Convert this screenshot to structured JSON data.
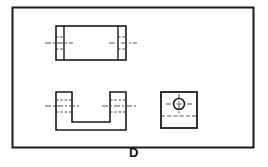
{
  "figure": {
    "label": "D",
    "frame": {
      "x": 12,
      "y": 7,
      "width": 242,
      "height": 141,
      "stroke": "#1a1a1a",
      "stroke_width": 2
    },
    "colors": {
      "background": "#ffffff",
      "line": "#1a1a1a",
      "hidden_line": "#555555",
      "center_line": "#555555",
      "label": "#111111"
    },
    "views": [
      {
        "name": "top-view",
        "description": "Rectangular front/top view with two vertical section strips and hidden holes",
        "outer_rect": {
          "x": 56,
          "y": 26,
          "width": 70,
          "height": 34
        },
        "inner_vertical_lines_x": [
          64,
          118
        ],
        "centerline_y": 43,
        "centerline_left": {
          "x1": 45,
          "x2": 72
        },
        "centerline_right": {
          "x1": 110,
          "x2": 137
        },
        "hidden_lines_left": [
          {
            "x1": 56,
            "x2": 64,
            "y": 37
          },
          {
            "x1": 56,
            "x2": 64,
            "y": 49
          }
        ],
        "hidden_lines_right": [
          {
            "x1": 118,
            "x2": 126,
            "y": 37
          },
          {
            "x1": 118,
            "x2": 126,
            "y": 49
          }
        ]
      },
      {
        "name": "front-view-channel",
        "description": "U-shaped channel section view with two upright legs and hidden holes",
        "outline_points": "56,92 72,92 72,122 110,122 110,92 126,92 126,130 56,130 56,92",
        "left_leg": {
          "x": 56,
          "y": 92,
          "width": 16,
          "height": 38
        },
        "right_leg": {
          "x": 110,
          "y": 92,
          "width": 16,
          "height": 38
        },
        "inner_bottom_y": 122,
        "outer_bottom_y": 130,
        "centerline_y": 106,
        "centerline_left": {
          "x1": 45,
          "x2": 80
        },
        "centerline_right": {
          "x1": 102,
          "x2": 137
        },
        "hidden_lines_left": [
          {
            "x1": 56,
            "x2": 72,
            "y": 100
          },
          {
            "x1": 56,
            "x2": 72,
            "y": 112
          }
        ],
        "hidden_lines_right": [
          {
            "x1": 110,
            "x2": 126,
            "y": 100
          },
          {
            "x1": 110,
            "x2": 126,
            "y": 112
          }
        ]
      },
      {
        "name": "side-view-square",
        "description": "Square end view with circular hole and crosshair centerlines plus hidden edge line",
        "square": {
          "x": 161,
          "y": 92,
          "width": 36,
          "height": 36
        },
        "circle": {
          "cx": 179,
          "cy": 104,
          "r": 5.5
        },
        "crosshair_horizontal": {
          "x1": 167,
          "x2": 191,
          "y": 104
        },
        "crosshair_vertical": {
          "y1": 95,
          "y2": 113,
          "x": 179
        },
        "hidden_line": {
          "x1": 161,
          "x2": 197,
          "y": 116
        }
      }
    ]
  }
}
